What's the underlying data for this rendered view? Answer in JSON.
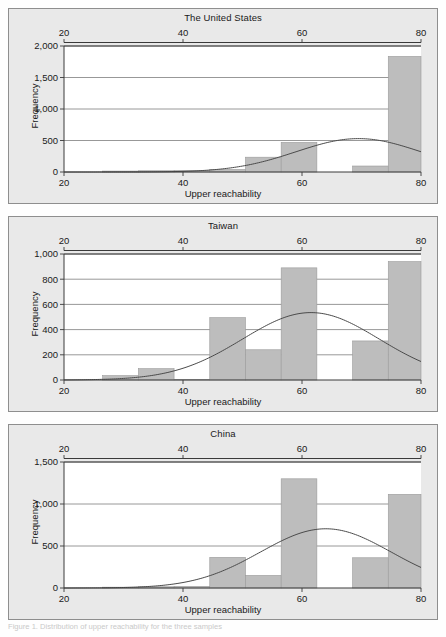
{
  "figure": {
    "xlabel": "Upper reachability",
    "ylabel": "Frequency",
    "caption": "Figure 1. Distribution of upper reachability for the three samples"
  },
  "chart_data": [
    {
      "type": "bar",
      "title": "The United States",
      "xlabel": "Upper reachability",
      "ylabel": "Frequency",
      "xlim": [
        20,
        80
      ],
      "ylim": [
        0,
        2000
      ],
      "xticks": [
        20,
        40,
        60,
        80
      ],
      "xticklabels": [
        "20",
        "40",
        "60",
        "80"
      ],
      "yticks": [
        0,
        500,
        1000,
        1500,
        2000
      ],
      "yticklabels": [
        "0",
        "500",
        "1,000",
        "1,500",
        "2,000"
      ],
      "grid": true,
      "top_axis": true,
      "bin_edges": [
        26.5,
        32.5,
        38.5,
        44.5,
        50.5,
        56.5,
        62.5,
        68.5,
        74.5,
        80.5
      ],
      "values": [
        15,
        20,
        25,
        40,
        235,
        470,
        0,
        95,
        1835
      ],
      "curve": {
        "name": "normal-distribution-overlay",
        "mean": 69.5,
        "sigma": 10.5,
        "peak": 530
      }
    },
    {
      "type": "bar",
      "title": "Taiwan",
      "xlabel": "Upper reachability",
      "ylabel": "Frequency",
      "xlim": [
        20,
        80
      ],
      "ylim": [
        0,
        1000
      ],
      "xticks": [
        20,
        40,
        60,
        80
      ],
      "xticklabels": [
        "20",
        "40",
        "60",
        "80"
      ],
      "yticks": [
        0,
        200,
        400,
        600,
        800,
        1000
      ],
      "yticklabels": [
        "0",
        "200",
        "400",
        "600",
        "800",
        "1,000"
      ],
      "grid": true,
      "top_axis": true,
      "bin_edges": [
        26.5,
        32.5,
        38.5,
        44.5,
        50.5,
        56.5,
        62.5,
        68.5,
        74.5,
        80.5
      ],
      "values": [
        35,
        90,
        5,
        495,
        240,
        890,
        0,
        310,
        940
      ],
      "curve": {
        "name": "normal-distribution-overlay",
        "mean": 61.5,
        "sigma": 11.5,
        "peak": 535
      }
    },
    {
      "type": "bar",
      "title": "China",
      "xlabel": "Upper reachability",
      "ylabel": "Frequency",
      "xlim": [
        20,
        80
      ],
      "ylim": [
        0,
        1500
      ],
      "xticks": [
        20,
        40,
        60,
        80
      ],
      "xticklabels": [
        "20",
        "40",
        "60",
        "80"
      ],
      "yticks": [
        0,
        500,
        1000,
        1500
      ],
      "yticklabels": [
        "0",
        "500",
        "1,000",
        "1,500"
      ],
      "grid": true,
      "top_axis": true,
      "bin_edges": [
        26.5,
        32.5,
        38.5,
        44.5,
        50.5,
        56.5,
        62.5,
        68.5,
        74.5,
        80.5
      ],
      "values": [
        10,
        15,
        20,
        365,
        150,
        1300,
        0,
        360,
        1115
      ],
      "curve": {
        "name": "normal-distribution-overlay",
        "mean": 64.0,
        "sigma": 11.0,
        "peak": 705
      }
    }
  ],
  "style": {
    "panel_bg": "#e9e9e9",
    "plot_bg": "#ffffff",
    "bar_fill": "#bdbdbd",
    "bar_stroke": "#9a9a9a",
    "axis_color": "#3a3a3a",
    "grid_color": "#7d7d7d",
    "curve_color": "#4a4a4a",
    "text_color": "#1a1a1a"
  }
}
